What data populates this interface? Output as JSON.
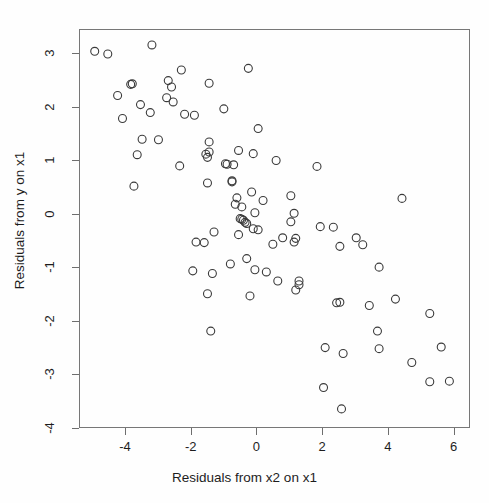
{
  "figure": {
    "background_color": "#fefefe",
    "plot_frame_color": "#777777",
    "point_color": "#3a3a3a",
    "point_radius": 4
  },
  "chart_data": {
    "type": "scatter",
    "title": "",
    "xlabel": "Residuals from x2 on x1",
    "ylabel": "Residuals from y on x1",
    "xlim": [
      -5.4,
      6.5
    ],
    "ylim": [
      -4.0,
      3.45
    ],
    "xticks": [
      -4,
      -2,
      0,
      2,
      4,
      6
    ],
    "xticklabels": [
      "-4",
      "-2",
      "0",
      "2",
      "4",
      "6"
    ],
    "yticks": [
      3,
      2,
      1,
      0,
      -1,
      -2,
      -3,
      -4
    ],
    "yticklabels": [
      "3",
      "2",
      "1",
      "0",
      "-1",
      "-2",
      "-3",
      "-4"
    ],
    "grid": false,
    "legend": null,
    "marker": "open-circle",
    "n_points": 122,
    "points": [
      [
        -4.95,
        3.05
      ],
      [
        -4.55,
        3.0
      ],
      [
        -3.2,
        3.17
      ],
      [
        -2.3,
        2.7
      ],
      [
        -0.25,
        2.73
      ],
      [
        -1.45,
        2.45
      ],
      [
        -2.7,
        2.5
      ],
      [
        -2.6,
        2.38
      ],
      [
        -3.85,
        2.43
      ],
      [
        -3.8,
        2.44
      ],
      [
        -4.25,
        2.22
      ],
      [
        -2.75,
        2.18
      ],
      [
        -2.55,
        2.1
      ],
      [
        -3.55,
        2.05
      ],
      [
        -1.0,
        1.97
      ],
      [
        -3.25,
        1.9
      ],
      [
        -4.1,
        1.79
      ],
      [
        -2.2,
        1.87
      ],
      [
        -1.9,
        1.85
      ],
      [
        0.05,
        1.6
      ],
      [
        -3.5,
        1.4
      ],
      [
        -3.0,
        1.39
      ],
      [
        -1.45,
        1.35
      ],
      [
        -0.55,
        1.19
      ],
      [
        -0.1,
        1.13
      ],
      [
        -1.55,
        1.12
      ],
      [
        -1.5,
        1.06
      ],
      [
        -1.45,
        1.16
      ],
      [
        -3.65,
        1.11
      ],
      [
        0.6,
        1.0
      ],
      [
        -0.95,
        0.94
      ],
      [
        -0.9,
        0.93
      ],
      [
        -0.7,
        0.92
      ],
      [
        -2.35,
        0.9
      ],
      [
        1.85,
        0.89
      ],
      [
        -3.75,
        0.52
      ],
      [
        -1.5,
        0.58
      ],
      [
        -0.75,
        0.6
      ],
      [
        -0.75,
        0.62
      ],
      [
        -0.15,
        0.41
      ],
      [
        4.45,
        0.29
      ],
      [
        0.2,
        0.25
      ],
      [
        -0.6,
        0.3
      ],
      [
        1.05,
        0.34
      ],
      [
        -0.65,
        0.18
      ],
      [
        -0.45,
        0.13
      ],
      [
        -0.05,
        0.02
      ],
      [
        1.15,
        0.01
      ],
      [
        -0.5,
        -0.09
      ],
      [
        -0.45,
        -0.1
      ],
      [
        -0.4,
        -0.12
      ],
      [
        -0.35,
        -0.16
      ],
      [
        -0.3,
        -0.18
      ],
      [
        1.05,
        -0.15
      ],
      [
        -0.1,
        -0.28
      ],
      [
        0.05,
        -0.3
      ],
      [
        -0.55,
        -0.39
      ],
      [
        -1.3,
        -0.34
      ],
      [
        1.95,
        -0.24
      ],
      [
        2.35,
        -0.25
      ],
      [
        -1.85,
        -0.53
      ],
      [
        -1.6,
        -0.54
      ],
      [
        0.8,
        -0.45
      ],
      [
        1.2,
        -0.46
      ],
      [
        1.15,
        -0.53
      ],
      [
        3.05,
        -0.45
      ],
      [
        0.5,
        -0.57
      ],
      [
        2.55,
        -0.61
      ],
      [
        3.25,
        -0.58
      ],
      [
        -0.3,
        -0.84
      ],
      [
        -0.8,
        -0.94
      ],
      [
        3.75,
        -1.0
      ],
      [
        -0.05,
        -1.05
      ],
      [
        0.3,
        -1.09
      ],
      [
        -1.95,
        -1.07
      ],
      [
        -1.35,
        -1.12
      ],
      [
        0.65,
        -1.26
      ],
      [
        1.3,
        -1.26
      ],
      [
        1.3,
        -1.33
      ],
      [
        1.2,
        -1.43
      ],
      [
        -1.5,
        -1.5
      ],
      [
        -0.2,
        -1.54
      ],
      [
        2.45,
        -1.67
      ],
      [
        2.55,
        -1.66
      ],
      [
        3.45,
        -1.72
      ],
      [
        4.25,
        -1.6
      ],
      [
        5.3,
        -1.87
      ],
      [
        -1.4,
        -2.2
      ],
      [
        3.7,
        -2.2
      ],
      [
        2.1,
        -2.51
      ],
      [
        2.65,
        -2.62
      ],
      [
        3.75,
        -2.53
      ],
      [
        5.65,
        -2.5
      ],
      [
        4.75,
        -2.79
      ],
      [
        2.05,
        -3.26
      ],
      [
        5.3,
        -3.15
      ],
      [
        5.9,
        -3.14
      ],
      [
        2.6,
        -3.66
      ]
    ],
    "correlation_note": "negative association"
  }
}
